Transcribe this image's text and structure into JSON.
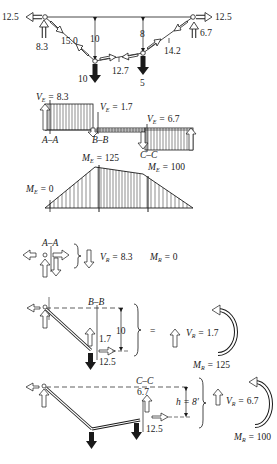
{
  "cable_diagram": {
    "left_support": {
      "horizontal": "12.5",
      "vertical": "8.3"
    },
    "right_support": {
      "horizontal": "12.5",
      "vertical": "6.7"
    },
    "segment_tensions": [
      "15.0",
      "12.7",
      "14.2"
    ],
    "sags": [
      "10",
      "8"
    ],
    "loads": [
      "10",
      "5"
    ]
  },
  "shear_diagram": {
    "labels": {
      "v1": "8.3",
      "v2": "1.7",
      "v3": "6.7"
    },
    "v_symbol": "V",
    "v_subscript": "E",
    "sections": [
      "A–A",
      "B–B",
      "C–C"
    ]
  },
  "moment_diagram": {
    "m_symbol": "M",
    "m_subscript": "E",
    "values": {
      "left": "0",
      "peak": "125",
      "right": "100"
    }
  },
  "section_aa": {
    "label": "A–A",
    "V_symbol": "V",
    "V_sub": "R",
    "V_value": "8.3",
    "M_symbol": "M",
    "M_sub": "R",
    "M_value": "0"
  },
  "section_bb": {
    "label": "B–B",
    "dim": "10",
    "vert_force": "1.7",
    "horiz_force": "12.5",
    "equals": "=",
    "V_symbol": "V",
    "V_sub": "R",
    "V_value": "1.7",
    "M_symbol": "M",
    "M_sub": "R",
    "M_value": "125"
  },
  "section_cc": {
    "label": "C–C",
    "vert_force": "6.7",
    "horiz_force": "12.5",
    "h_label": "h = 8′",
    "V_symbol": "V",
    "V_sub": "R",
    "V_value": "6.7",
    "M_symbol": "M",
    "M_sub": "R",
    "M_value": "100"
  }
}
